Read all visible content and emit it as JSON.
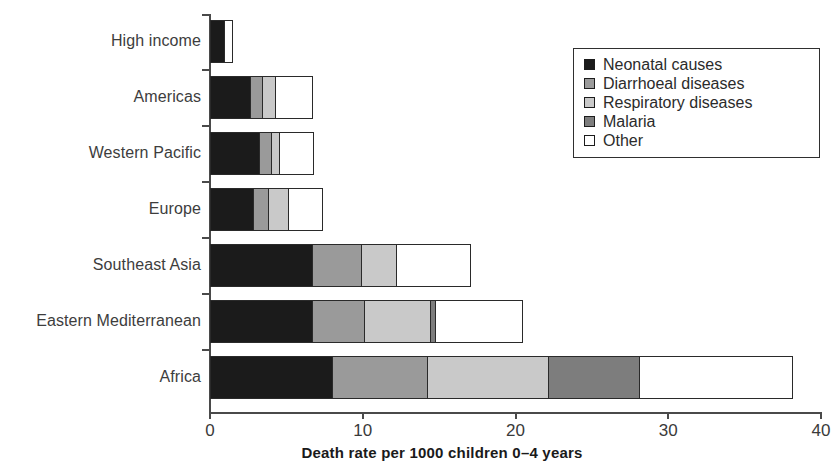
{
  "chart_data": {
    "type": "bar",
    "orientation": "horizontal",
    "stacked": true,
    "title": "",
    "xlabel": "Death rate per 1000 children 0–4 years",
    "ylabel": "",
    "xlim": [
      0,
      40
    ],
    "xticks": [
      0,
      10,
      20,
      30,
      40
    ],
    "xtick_labels": [
      "0",
      "10",
      "20",
      "30",
      "40"
    ],
    "grid": false,
    "legend_position": "upper right",
    "categories": [
      "High income",
      "Americas",
      "Western Pacific",
      "Europe",
      "Southeast Asia",
      "Eastern Mediterranean",
      "Africa"
    ],
    "series": [
      {
        "name": "Neonatal causes",
        "color": "#1b1b1b",
        "values": [
          0.9,
          2.6,
          3.2,
          2.8,
          6.7,
          6.7,
          8.0
        ]
      },
      {
        "name": "Diarrhoeal diseases",
        "color": "#9a9a9a",
        "values": [
          0.0,
          0.8,
          0.8,
          1.0,
          3.2,
          3.4,
          6.2
        ]
      },
      {
        "name": "Respiratory diseases",
        "color": "#c9c9c9",
        "values": [
          0.0,
          0.85,
          0.5,
          1.3,
          2.3,
          4.3,
          7.9
        ]
      },
      {
        "name": "Malaria",
        "color": "#7d7d7d",
        "values": [
          0.0,
          0.0,
          0.0,
          0.0,
          0.0,
          0.3,
          6.0
        ]
      },
      {
        "name": "Other",
        "color": "#ffffff",
        "values": [
          0.6,
          2.5,
          2.3,
          2.3,
          4.9,
          5.8,
          10.1
        ]
      }
    ],
    "totals": [
      1.5,
      6.75,
      6.8,
      7.4,
      17.1,
      20.5,
      38.2
    ]
  },
  "legend": {
    "items": [
      {
        "label": "Neonatal causes",
        "color": "#1b1b1b"
      },
      {
        "label": "Diarrhoeal diseases",
        "color": "#9a9a9a"
      },
      {
        "label": "Respiratory diseases",
        "color": "#c9c9c9"
      },
      {
        "label": "Malaria",
        "color": "#7d7d7d"
      },
      {
        "label": "Other",
        "color": "#ffffff"
      }
    ]
  },
  "axis": {
    "x_title": "Death rate per 1000 children 0–4 years",
    "tick_labels": [
      "0",
      "10",
      "20",
      "30",
      "40"
    ]
  },
  "colors": {
    "neonatal": "#1b1b1b",
    "diarrhoeal": "#9a9a9a",
    "respiratory": "#c9c9c9",
    "malaria": "#7d7d7d",
    "other": "#ffffff",
    "axis": "#4a4a4a",
    "outline": "#2a2a2a",
    "background": "#ffffff"
  }
}
